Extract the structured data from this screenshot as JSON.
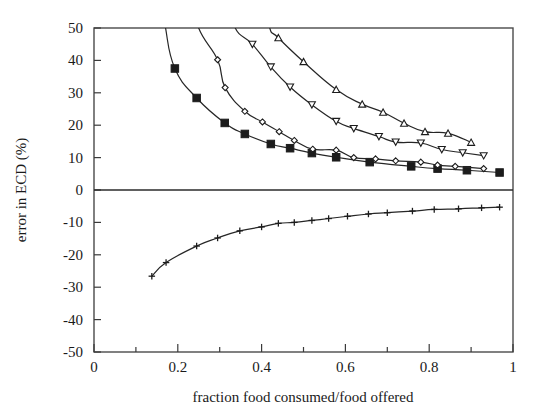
{
  "chart_data": {
    "type": "line",
    "title": "",
    "xlabel": "fraction food consumed/food offered",
    "ylabel": "error in ECD (%)",
    "xlim": [
      0,
      1
    ],
    "ylim": [
      -50,
      50
    ],
    "xticks": [
      0,
      0.2,
      0.4,
      0.6,
      0.8,
      1
    ],
    "xtick_labels": [
      "0",
      "0.2",
      "0.4",
      "0.6",
      "0.8",
      "1"
    ],
    "x_minor_tick_step": 0.1,
    "yticks": [
      50,
      40,
      30,
      20,
      10,
      0,
      -10,
      -20,
      -30,
      -40,
      -50
    ],
    "ytick_labels": [
      "50",
      "40",
      "30",
      "20",
      "10",
      "0",
      "-10",
      "-20",
      "-30",
      "-40",
      "-50"
    ],
    "grid": false,
    "legend": "none",
    "zero_line": 0,
    "series": [
      {
        "name": "series-1",
        "marker": "filled-square",
        "marker_size": 7.5,
        "x": [
          0.193,
          0.245,
          0.312,
          0.36,
          0.422,
          0.468,
          0.52,
          0.578,
          0.658,
          0.757,
          0.82,
          0.89,
          0.968
        ],
        "y": [
          37.5,
          28.4,
          20.7,
          17.3,
          14.2,
          12.9,
          11.4,
          10.1,
          8.6,
          7.3,
          6.6,
          6.1,
          5.4
        ],
        "exit_top_x": 0.17
      },
      {
        "name": "series-2",
        "marker": "open-diamond",
        "marker_size": 6,
        "x": [
          0.295,
          0.313,
          0.36,
          0.402,
          0.442,
          0.478,
          0.522,
          0.578,
          0.62,
          0.672,
          0.72,
          0.78,
          0.82,
          0.862,
          0.93
        ],
        "y": [
          40.2,
          31.6,
          24.3,
          21.0,
          18.0,
          15.3,
          12.6,
          12.3,
          10.0,
          9.6,
          9.0,
          8.6,
          7.7,
          7.3,
          6.6
        ],
        "exit_top_x": 0.248
      },
      {
        "name": "series-3",
        "marker": "open-down-triangle",
        "marker_size": 7,
        "x": [
          0.378,
          0.422,
          0.468,
          0.52,
          0.578,
          0.62,
          0.68,
          0.72,
          0.78,
          0.83,
          0.88,
          0.93
        ],
        "y": [
          45.0,
          38.0,
          31.8,
          26.3,
          21.2,
          19.0,
          16.5,
          14.8,
          14.5,
          12.5,
          11.5,
          10.6
        ],
        "exit_top_x": 0.335
      },
      {
        "name": "series-4",
        "marker": "open-up-triangle",
        "marker_size": 7,
        "x": [
          0.44,
          0.5,
          0.578,
          0.64,
          0.69,
          0.74,
          0.79,
          0.845,
          0.9
        ],
        "y": [
          47.0,
          39.6,
          31.0,
          26.5,
          24.0,
          20.6,
          18.0,
          17.5,
          14.7
        ],
        "exit_top_x": 0.418
      },
      {
        "name": "series-5",
        "marker": "plus",
        "marker_size": 6.5,
        "x": [
          0.138,
          0.172,
          0.245,
          0.295,
          0.348,
          0.4,
          0.44,
          0.478,
          0.52,
          0.56,
          0.605,
          0.655,
          0.7,
          0.76,
          0.812,
          0.87,
          0.925,
          0.968
        ],
        "y": [
          -26.6,
          -22.4,
          -17.3,
          -14.8,
          -12.6,
          -11.4,
          -10.3,
          -10.0,
          -9.4,
          -8.8,
          -8.1,
          -7.4,
          -7.0,
          -6.5,
          -6.0,
          -5.8,
          -5.5,
          -5.3
        ]
      }
    ]
  },
  "axes": {
    "x_title": "fraction food consumed/food offered",
    "y_title": "error in ECD (%)"
  }
}
